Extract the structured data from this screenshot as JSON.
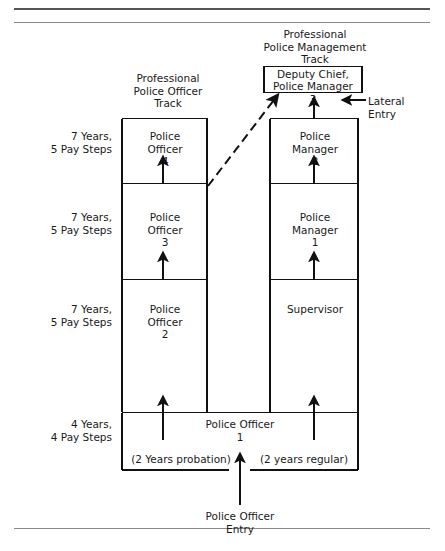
{
  "figure": {
    "title_left_track": "Professional\nPolice Officer\nTrack",
    "title_right_track": "Professional\nPolice Management\nTrack",
    "lateral_entry_label": "Lateral\nEntry",
    "entry_label": "Police Officer\nEntry"
  },
  "tenure_labels": [
    {
      "id": "tenure-1",
      "text": "7 Years,\n5 Pay Steps"
    },
    {
      "id": "tenure-2",
      "text": "7 Years,\n5 Pay Steps"
    },
    {
      "id": "tenure-3",
      "text": "7 Years,\n5 Pay Steps"
    },
    {
      "id": "tenure-4",
      "text": "4 Years,\n4 Pay Steps"
    }
  ],
  "left_track": {
    "name": "Professional Police Officer Track",
    "ranks": [
      {
        "id": "police-officer-4",
        "text": "Police\nOfficer\n4"
      },
      {
        "id": "police-officer-3",
        "text": "Police\nOfficer\n3"
      },
      {
        "id": "police-officer-2",
        "text": "Police\nOfficer\n2"
      }
    ]
  },
  "right_track": {
    "name": "Professional Police Management Track",
    "top_box": {
      "id": "deputy-chief",
      "text": "Deputy Chief,\nPolice Manager"
    },
    "top_box_number": "3",
    "ranks": [
      {
        "id": "police-manager-2",
        "text": "Police\nManager\n2"
      },
      {
        "id": "police-manager-1",
        "text": "Police\nManager\n1"
      },
      {
        "id": "supervisor",
        "text": "Supervisor"
      }
    ]
  },
  "base": {
    "title": "Police Officer\n1",
    "left_note": "(2 Years probation)",
    "right_note": "(2 years regular)"
  },
  "colors": {
    "ink": "#1a1a1a",
    "rule": "#555555",
    "paper": "#ffffff"
  }
}
